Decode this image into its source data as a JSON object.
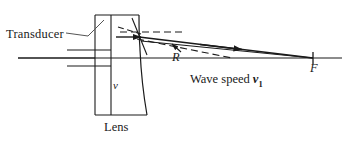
{
  "figure": {
    "type": "optics-ray-diagram",
    "background_color": "#ffffff",
    "ink_color": "#1a1a1a",
    "width": 342,
    "height": 144
  },
  "labels": {
    "transducer": "Transducer",
    "lens": "Lens",
    "lens_speed": "v",
    "radius": "R",
    "focal_point": "F",
    "wave_speed_text": "Wave speed",
    "wave_speed_symbol": "v",
    "wave_speed_subscript": "1"
  },
  "elements": {
    "optical_axis": "horizontal-axis-line",
    "lens_body": "rectangular-lens-with-concave-right-face",
    "transducer_face": "vertical-transducer-line",
    "incident_rays": "parallel-horizontal-rays",
    "refracted_rays": "converging-rays-to-focus",
    "construction_lines": "dashed-normal-and-radius-lines",
    "focus_tick": "focal-point-tick-mark",
    "leader_line": "transducer-leader-line",
    "radius_arrow": "radius-indicator-arrow"
  },
  "geometry": {
    "axis_y": 58,
    "lens_left_x": 95,
    "lens_mid_x": 111,
    "lens_top_y": 15,
    "lens_bottom_y": 115,
    "refraction_point_x": 140,
    "refraction_point_y": 37,
    "focus_x": 313,
    "focus_y": 58
  }
}
